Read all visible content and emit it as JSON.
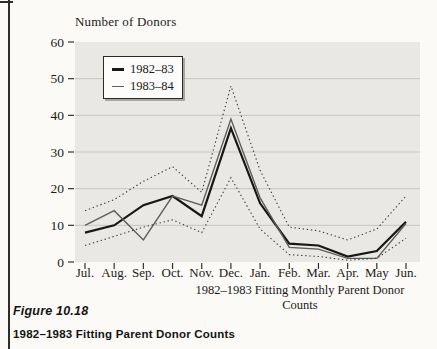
{
  "page": {
    "background": "#fbfaf7"
  },
  "figure": {
    "label": "Figure 10.18",
    "caption": "1982–1983 Fitting Parent Donor Counts"
  },
  "colors": {
    "plot_background": "#e9e8e4",
    "gridline": "#c7c6c1",
    "tick": "#33322f",
    "line_1982_83": "#171715",
    "line_1983_84": "#5d5d5b",
    "prediction_band": "#3e3d3b"
  },
  "chart_data": {
    "type": "line",
    "title": "Number of Donors",
    "xlabel": "1982–1983 Fitting Monthly Parent Donor Counts",
    "ylabel": "Number of Donors",
    "categories": [
      "Jul.",
      "Aug.",
      "Sep.",
      "Oct.",
      "Nov.",
      "Dec.",
      "Jan.",
      "Feb.",
      "Mar.",
      "Apr.",
      "May",
      "Jun."
    ],
    "yticks": [
      0,
      10,
      20,
      30,
      40,
      50,
      60
    ],
    "ylim": [
      0,
      60
    ],
    "grid": true,
    "legend_position": "top-left",
    "legend": {
      "entries": [
        {
          "label": "1982–83"
        },
        {
          "label": "1983–84"
        }
      ]
    },
    "series": [
      {
        "name": "1982–83",
        "description": "fitted 1982-83 donor counts (thick solid line)",
        "style": "solid",
        "stroke_width": 2.2,
        "color": "#171715",
        "values": [
          8,
          10,
          15.5,
          18,
          12.5,
          36.5,
          16,
          5,
          4.5,
          1.5,
          3,
          11
        ]
      },
      {
        "name": "1983–84",
        "description": "actual 1983-84 donor counts (thin solid line)",
        "style": "solid",
        "stroke_width": 1.4,
        "color": "#5d5d5b",
        "values": [
          10,
          14,
          6,
          18,
          15.5,
          39,
          17.5,
          4,
          3.5,
          1,
          1,
          10.5
        ]
      },
      {
        "name": "upper-prediction-limit",
        "description": "upper dotted prediction band",
        "style": "dotted",
        "stroke_width": 1.1,
        "color": "#3e3d3b",
        "values": [
          14,
          17,
          22,
          26,
          19,
          48,
          25,
          9.5,
          8.5,
          6,
          9,
          18
        ]
      },
      {
        "name": "lower-prediction-limit",
        "description": "lower dotted prediction band",
        "style": "dotted",
        "stroke_width": 1.1,
        "color": "#3e3d3b",
        "values": [
          4.5,
          7,
          9.5,
          11.5,
          8,
          23,
          9,
          2,
          1.5,
          0.5,
          1,
          6.5
        ]
      }
    ]
  }
}
